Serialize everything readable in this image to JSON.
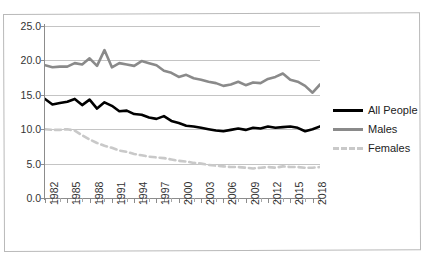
{
  "caption_remnant": "",
  "chart_data": {
    "type": "line",
    "title": "",
    "subtitle": "",
    "xlabel": "",
    "ylabel": "",
    "xlim": [
      1982,
      2019
    ],
    "ylim": [
      0.0,
      25.0
    ],
    "ytick_labels": [
      "25.0",
      "20.0",
      "15.0",
      "10.0",
      "5.0",
      "0.0"
    ],
    "ytick_values": [
      25.0,
      20.0,
      15.0,
      10.0,
      5.0,
      0.0
    ],
    "grid": true,
    "legend_position": "right",
    "x": [
      1982,
      1983,
      1984,
      1985,
      1986,
      1987,
      1988,
      1989,
      1990,
      1991,
      1992,
      1993,
      1994,
      1995,
      1996,
      1997,
      1998,
      1999,
      2000,
      2001,
      2002,
      2003,
      2004,
      2005,
      2006,
      2007,
      2008,
      2009,
      2010,
      2011,
      2012,
      2013,
      2014,
      2015,
      2016,
      2017,
      2018,
      2019
    ],
    "xtick_labels": [
      "1982",
      "1985",
      "1988",
      "1991",
      "1994",
      "1997",
      "2000",
      "2003",
      "2006",
      "2009",
      "2012",
      "2015",
      "2018"
    ],
    "xtick_values": [
      1982,
      1985,
      1988,
      1991,
      1994,
      1997,
      2000,
      2003,
      2006,
      2009,
      2012,
      2015,
      2018
    ],
    "series": [
      {
        "name": "All People",
        "color": "#000000",
        "style": "solid",
        "width": 2.6,
        "values": [
          14.4,
          13.6,
          13.8,
          14.0,
          14.4,
          13.5,
          14.3,
          13.0,
          13.9,
          13.4,
          12.6,
          12.7,
          12.2,
          12.1,
          11.7,
          11.5,
          11.9,
          11.2,
          10.9,
          10.5,
          10.4,
          10.2,
          10.0,
          9.8,
          9.7,
          9.9,
          10.1,
          9.9,
          10.2,
          10.1,
          10.4,
          10.2,
          10.3,
          10.4,
          10.2,
          9.7,
          10.0,
          10.4
        ]
      },
      {
        "name": "Males",
        "color": "#8a8a8a",
        "style": "solid",
        "width": 2.6,
        "values": [
          19.3,
          19.0,
          19.1,
          19.1,
          19.6,
          19.4,
          20.3,
          19.2,
          21.5,
          19.0,
          19.6,
          19.4,
          19.2,
          19.9,
          19.6,
          19.3,
          18.5,
          18.2,
          17.6,
          17.9,
          17.4,
          17.2,
          16.9,
          16.7,
          16.3,
          16.5,
          16.9,
          16.4,
          16.8,
          16.7,
          17.3,
          17.6,
          18.1,
          17.2,
          16.9,
          16.3,
          15.3,
          16.5
        ]
      },
      {
        "name": "Females",
        "color": "#c9c9c9",
        "style": "dashed",
        "width": 2.6,
        "values": [
          10.0,
          9.9,
          9.9,
          10.0,
          9.8,
          9.1,
          8.5,
          8.0,
          7.6,
          7.3,
          6.9,
          6.7,
          6.4,
          6.2,
          6.0,
          5.9,
          5.8,
          5.6,
          5.4,
          5.3,
          5.1,
          5.0,
          4.8,
          4.7,
          4.6,
          4.5,
          4.5,
          4.4,
          4.3,
          4.4,
          4.5,
          4.4,
          4.6,
          4.5,
          4.5,
          4.4,
          4.4,
          4.5
        ]
      }
    ]
  },
  "legend": {
    "items": [
      {
        "label": "All People"
      },
      {
        "label": "Males"
      },
      {
        "label": "Females"
      }
    ]
  }
}
